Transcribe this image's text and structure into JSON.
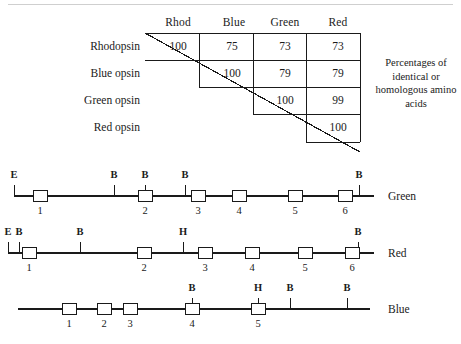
{
  "matrix": {
    "column_headers": [
      "Rhod",
      "Blue",
      "Green",
      "Red"
    ],
    "row_headers": [
      "Rhodopsin",
      "Blue opsin",
      "Green opsin",
      "Red opsin"
    ],
    "rows": [
      [
        "100",
        "75",
        "73",
        "73"
      ],
      [
        "",
        "100",
        "79",
        "79"
      ],
      [
        "",
        "",
        "100",
        "99"
      ],
      [
        "",
        "",
        "",
        "100"
      ]
    ],
    "caption": "Percentages of identical or homologous amino acids"
  },
  "maps": [
    {
      "name": "Green",
      "label": "Green",
      "exons": [
        {
          "num": "1",
          "x": 118
        },
        {
          "num": "2",
          "x": 138
        },
        {
          "num": "3",
          "x": 191
        },
        {
          "num": "4",
          "x": 232
        },
        {
          "num": "5",
          "x": 288
        },
        {
          "num": "6",
          "x": 338
        }
      ],
      "sites": [
        {
          "label": "E",
          "x": 14
        },
        {
          "label": "B",
          "x": 114
        },
        {
          "label": "B",
          "x": 145
        },
        {
          "label": "B",
          "x": 185
        },
        {
          "label": "B",
          "x": 359
        }
      ]
    },
    {
      "name": "Red",
      "label": "Red",
      "exons": [
        {
          "num": "1",
          "x": 22
        },
        {
          "num": "2",
          "x": 137
        },
        {
          "num": "3",
          "x": 198
        },
        {
          "num": "4",
          "x": 245
        },
        {
          "num": "5",
          "x": 298
        },
        {
          "num": "6",
          "x": 345
        }
      ],
      "sites": [
        {
          "label": "E",
          "x": 8
        },
        {
          "label": "B",
          "x": 19
        },
        {
          "label": "B",
          "x": 80
        },
        {
          "label": "H",
          "x": 183
        },
        {
          "label": "B",
          "x": 358
        }
      ]
    },
    {
      "name": "Blue",
      "label": "Blue",
      "exons": [
        {
          "num": "1",
          "x": 62
        },
        {
          "num": "2",
          "x": 97
        },
        {
          "num": "3",
          "x": 123
        },
        {
          "num": "4",
          "x": 192
        },
        {
          "num": "5",
          "x": 258
        }
      ],
      "sites": [
        {
          "label": "B",
          "x": 192
        },
        {
          "label": "H",
          "x": 258
        },
        {
          "label": "B",
          "x": 290
        },
        {
          "label": "B",
          "x": 347
        }
      ]
    }
  ],
  "colors": {
    "ink": "#1a1a1a",
    "rule": "#cfcfcf",
    "paper": "#ffffff"
  }
}
